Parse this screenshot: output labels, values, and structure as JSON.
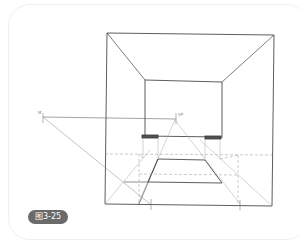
{
  "figure": {
    "caption": "图3-25"
  },
  "labels": {
    "measuring_point": "M",
    "vanishing_point": "VP"
  },
  "colors": {
    "line_dark": "#333333",
    "line_light": "#aaaaaa",
    "dashed": "#999999",
    "badge_bg": "#6a6a6a",
    "badge_text": "#ffffff"
  }
}
